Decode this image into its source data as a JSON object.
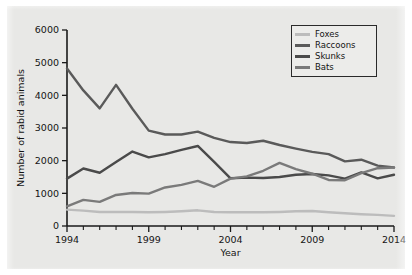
{
  "chart_data": {
    "type": "line",
    "title": "",
    "xlabel": "Year",
    "ylabel": "Number of rabid animals",
    "xlim": [
      1994,
      2014
    ],
    "ylim": [
      0,
      6000
    ],
    "ytick_values": [
      0,
      1000,
      2000,
      3000,
      4000,
      5000,
      6000
    ],
    "ytick_labels": [
      "0",
      "1000",
      "2000",
      "3000",
      "4000",
      "5000",
      "6000"
    ],
    "xtick_values": [
      1994,
      1999,
      2004,
      2009,
      2014
    ],
    "xtick_labels": [
      "1994",
      "1999",
      "2004",
      "2009",
      "2014"
    ],
    "x_minor_ticks": [
      1995,
      1996,
      1997,
      1998,
      2000,
      2001,
      2002,
      2003,
      2005,
      2006,
      2007,
      2008,
      2010,
      2011,
      2012,
      2013
    ],
    "grid": false,
    "legend_position": "top-right",
    "x": [
      1994,
      1995,
      1996,
      1997,
      1998,
      1999,
      2000,
      2001,
      2002,
      2003,
      2004,
      2005,
      2006,
      2007,
      2008,
      2009,
      2010,
      2011,
      2012,
      2013,
      2014
    ],
    "series": [
      {
        "name": "Foxes",
        "color": "#bcbcbc",
        "values": [
          500,
          470,
          430,
          430,
          430,
          420,
          430,
          450,
          480,
          430,
          420,
          420,
          420,
          430,
          450,
          460,
          420,
          390,
          360,
          340,
          310
        ]
      },
      {
        "name": "Raccoons",
        "color": "#5a5a5a",
        "values": [
          4820,
          4150,
          3600,
          4320,
          3590,
          2920,
          2800,
          2800,
          2890,
          2700,
          2570,
          2540,
          2610,
          2480,
          2370,
          2270,
          2200,
          1980,
          2030,
          1850,
          1790
        ]
      },
      {
        "name": "Skunks",
        "color": "#4a4a4a",
        "values": [
          1450,
          1760,
          1630,
          1960,
          2280,
          2100,
          2200,
          2330,
          2450,
          1960,
          1460,
          1480,
          1470,
          1500,
          1570,
          1590,
          1550,
          1450,
          1640,
          1460,
          1570
        ]
      },
      {
        "name": "Bats",
        "color": "#7a7a7a",
        "values": [
          600,
          800,
          740,
          950,
          1010,
          990,
          1180,
          1260,
          1380,
          1200,
          1450,
          1520,
          1690,
          1930,
          1740,
          1600,
          1410,
          1400,
          1620,
          1770,
          1790
        ]
      }
    ]
  },
  "legend": {
    "items": [
      {
        "label": "Foxes"
      },
      {
        "label": "Raccoons"
      },
      {
        "label": "Skunks"
      },
      {
        "label": "Bats"
      }
    ]
  }
}
